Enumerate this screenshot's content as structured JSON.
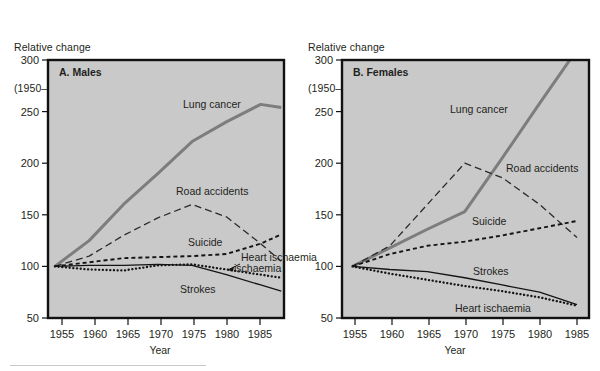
{
  "figure": {
    "background": "#ffffff",
    "plot_background": "#c9c9c9",
    "frame_color": "#111111"
  },
  "panels": [
    {
      "id": "males",
      "title": "A. Males",
      "ylabel_line1": "Relative change",
      "ylabel_line2": "(1950–54  =  100)",
      "xlabel": "Year",
      "yticks": [
        50,
        100,
        150,
        200,
        250,
        300
      ],
      "xticks": [
        1955,
        1960,
        1965,
        1970,
        1975,
        1980,
        1985
      ],
      "series_labels": [
        "Lung cancer",
        "Road accidents",
        "Suicide",
        "Heart ischaemia",
        "Strokes"
      ]
    },
    {
      "id": "females",
      "title": "B. Females",
      "ylabel_line1": "Relative change",
      "ylabel_line2": "(1950–54  =  100)",
      "xlabel": "Year",
      "yticks": [
        50,
        100,
        150,
        200,
        250,
        300
      ],
      "xticks": [
        1955,
        1960,
        1965,
        1970,
        1975,
        1980,
        1985
      ],
      "series_labels": [
        "Lung cancer",
        "Road accidents",
        "Suicide",
        "Strokes",
        "Heart ischaemia"
      ]
    }
  ],
  "chart_data": [
    {
      "type": "line",
      "title": "A. Males",
      "subtitle": "",
      "xlabel": "Year",
      "ylabel": "Relative change (1950–54 = 100)",
      "xlim": [
        1954,
        1988
      ],
      "ylim": [
        50,
        300
      ],
      "yticks": [
        50,
        100,
        150,
        200,
        250,
        300
      ],
      "xticks": [
        1955,
        1960,
        1965,
        1970,
        1975,
        1980,
        1985
      ],
      "grid": false,
      "legend": "inline-labels",
      "series": [
        {
          "name": "Lung cancer",
          "style": "thick-solid-grey",
          "color": "#7d7d7d",
          "x": [
            1955,
            1960,
            1965,
            1970,
            1975,
            1980,
            1985,
            1988
          ],
          "values": [
            100,
            125,
            160,
            190,
            221,
            240,
            257,
            254
          ]
        },
        {
          "name": "Road accidents",
          "style": "long-dash",
          "color": "#262626",
          "x": [
            1955,
            1960,
            1965,
            1970,
            1975,
            1980,
            1985,
            1988
          ],
          "values": [
            100,
            110,
            130,
            147,
            160,
            148,
            122,
            105
          ]
        },
        {
          "name": "Suicide",
          "style": "short-dash",
          "color": "#141414",
          "x": [
            1955,
            1960,
            1965,
            1970,
            1975,
            1980,
            1985,
            1988
          ],
          "values": [
            100,
            104,
            108,
            109,
            110,
            112,
            122,
            131
          ]
        },
        {
          "name": "Heart ischaemia",
          "style": "dotted",
          "color": "#141414",
          "x": [
            1955,
            1960,
            1965,
            1970,
            1975,
            1980,
            1985,
            1988
          ],
          "values": [
            100,
            97,
            96,
            101,
            102,
            97,
            92,
            89
          ]
        },
        {
          "name": "Strokes",
          "style": "thin-solid",
          "color": "#141414",
          "x": [
            1955,
            1960,
            1965,
            1970,
            1975,
            1980,
            1985,
            1988
          ],
          "values": [
            100,
            101,
            101,
            102,
            101,
            92,
            82,
            76
          ]
        }
      ]
    },
    {
      "type": "line",
      "title": "B. Females",
      "subtitle": "",
      "xlabel": "Year",
      "ylabel": "Relative change (1950–54 = 100)",
      "xlim": [
        1954,
        1988
      ],
      "ylim": [
        50,
        300
      ],
      "yticks": [
        50,
        100,
        150,
        200,
        250,
        300
      ],
      "xticks": [
        1955,
        1960,
        1965,
        1970,
        1975,
        1980,
        1985
      ],
      "grid": false,
      "legend": "inline-labels",
      "series": [
        {
          "name": "Lung cancer",
          "style": "thick-solid-grey",
          "color": "#7d7d7d",
          "x": [
            1955,
            1960,
            1965,
            1970,
            1975,
            1980,
            1985
          ],
          "values": [
            100,
            118,
            136,
            153,
            205,
            258,
            310
          ]
        },
        {
          "name": "Road accidents",
          "style": "long-dash",
          "color": "#262626",
          "x": [
            1955,
            1960,
            1965,
            1970,
            1975,
            1980,
            1985
          ],
          "values": [
            100,
            120,
            160,
            200,
            186,
            160,
            128
          ]
        },
        {
          "name": "Suicide",
          "style": "short-dash",
          "color": "#141414",
          "x": [
            1955,
            1960,
            1965,
            1970,
            1975,
            1980,
            1985
          ],
          "values": [
            100,
            112,
            120,
            124,
            130,
            137,
            144
          ]
        },
        {
          "name": "Strokes",
          "style": "thin-solid",
          "color": "#141414",
          "x": [
            1955,
            1960,
            1965,
            1970,
            1975,
            1980,
            1985
          ],
          "values": [
            100,
            97,
            95,
            89,
            82,
            75,
            63
          ]
        },
        {
          "name": "Heart ischaemia",
          "style": "dotted",
          "color": "#141414",
          "x": [
            1955,
            1960,
            1965,
            1970,
            1975,
            1980,
            1985
          ],
          "values": [
            100,
            93,
            87,
            81,
            76,
            70,
            62
          ]
        }
      ]
    }
  ]
}
